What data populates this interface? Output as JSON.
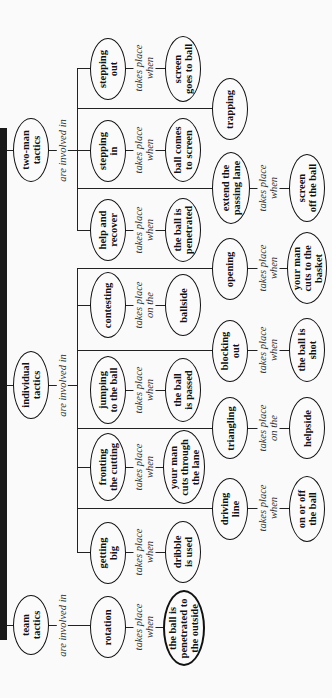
{
  "diagram": {
    "type": "concept-map",
    "orientation": "rotated-90-ccw",
    "roots": [
      {
        "id": "two_man",
        "label": "two-man\ntactics",
        "relation": "are involved in"
      },
      {
        "id": "individual",
        "label": "individual\ntactics",
        "relation": "are involved in"
      },
      {
        "id": "team",
        "label": "team\ntactics",
        "relation": "are involved in"
      }
    ],
    "labels": {
      "are_involved_in": "are involved in",
      "takes_place_when": "takes place\nwhen",
      "takes_place_on_the": "takes place\non the"
    },
    "nodes": {
      "two_man": "two-man\ntactics",
      "individual": "individual\ntactics",
      "team": "team\ntactics",
      "stepping_out": "stepping\nout",
      "stepping_in": "stepping\nin",
      "help_recover": "help and\nrecover",
      "contesting": "contesting",
      "jumping": "jumping\nto the ball",
      "fronting": "fronting\nthe cutting",
      "getting_big": "getting\nbig",
      "rotation": "rotation",
      "screen_goes": "screen\ngoes to ball",
      "ball_comes": "ball comes\nto screen",
      "ball_penetrated": "the ball is\npenetrated",
      "ballside": "ballside",
      "ball_passed": "the ball\nis passed",
      "man_cuts_lane": "your man\ncuts through\nthe lane",
      "dribble": "dribble\nis used",
      "penetrated_outside": "the ball is\npenetrated to\nthe outside",
      "trapping": "trapping",
      "extend_lane": "extend the\npassing lane",
      "opening": "opening",
      "blocking_out": "blocking\nout",
      "triangling": "triangling",
      "driving_line": "driving\nline",
      "screen_off": "screen\noff the ball",
      "man_cuts_basket": "your man\ncuts to the\nbasket",
      "ball_shot": "the ball is\nshot",
      "helpside": "helpside",
      "on_off_ball": "on or off\nthe ball"
    },
    "edges": [
      {
        "from": "two_man",
        "to": "stepping_out",
        "label": "are involved in"
      },
      {
        "from": "two_man",
        "to": "stepping_in",
        "label": "are involved in"
      },
      {
        "from": "two_man",
        "to": "help_recover",
        "label": "are involved in"
      },
      {
        "from": "two_man",
        "to": "trapping",
        "label": "are involved in"
      },
      {
        "from": "two_man",
        "to": "extend_lane",
        "label": "are involved in"
      },
      {
        "from": "stepping_out",
        "to": "screen_goes",
        "label": "takes place when"
      },
      {
        "from": "stepping_in",
        "to": "ball_comes",
        "label": "takes place when"
      },
      {
        "from": "help_recover",
        "to": "ball_penetrated",
        "label": "takes place when"
      },
      {
        "from": "extend_lane",
        "to": "screen_off",
        "label": "takes place when"
      },
      {
        "from": "individual",
        "to": "contesting",
        "label": "are involved in"
      },
      {
        "from": "individual",
        "to": "jumping",
        "label": "are involved in"
      },
      {
        "from": "individual",
        "to": "fronting",
        "label": "are involved in"
      },
      {
        "from": "individual",
        "to": "getting_big",
        "label": "are involved in"
      },
      {
        "from": "individual",
        "to": "opening",
        "label": "are involved in"
      },
      {
        "from": "individual",
        "to": "blocking_out",
        "label": "are involved in"
      },
      {
        "from": "individual",
        "to": "triangling",
        "label": "are involved in"
      },
      {
        "from": "individual",
        "to": "driving_line",
        "label": "are involved in"
      },
      {
        "from": "contesting",
        "to": "ballside",
        "label": "takes place on the"
      },
      {
        "from": "jumping",
        "to": "ball_passed",
        "label": "takes place when"
      },
      {
        "from": "fronting",
        "to": "man_cuts_lane",
        "label": "takes place when"
      },
      {
        "from": "getting_big",
        "to": "dribble",
        "label": "takes place when"
      },
      {
        "from": "opening",
        "to": "man_cuts_basket",
        "label": "takes place when"
      },
      {
        "from": "blocking_out",
        "to": "ball_shot",
        "label": "takes place when"
      },
      {
        "from": "triangling",
        "to": "helpside",
        "label": "takes place on the"
      },
      {
        "from": "driving_line",
        "to": "on_off_ball",
        "label": "takes place when"
      },
      {
        "from": "team",
        "to": "rotation",
        "label": "are involved in"
      },
      {
        "from": "rotation",
        "to": "penetrated_outside",
        "label": "takes place when"
      }
    ]
  }
}
